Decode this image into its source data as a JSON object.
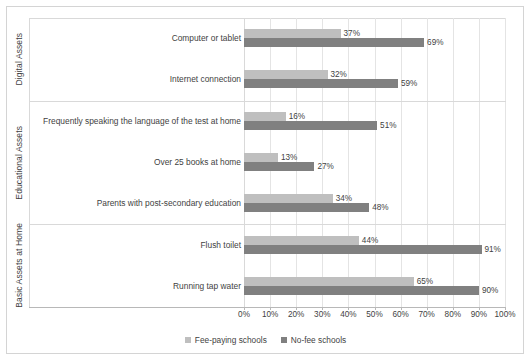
{
  "chart_data": {
    "type": "bar",
    "orientation": "horizontal",
    "title": "",
    "xlabel": "",
    "ylabel": "",
    "xlim": [
      0,
      100
    ],
    "xtick_labels": [
      "0%",
      "10%",
      "20%",
      "30%",
      "40%",
      "50%",
      "60%",
      "70%",
      "80%",
      "90%",
      "100%"
    ],
    "xtick_values": [
      0,
      10,
      20,
      30,
      40,
      50,
      60,
      70,
      80,
      90,
      100
    ],
    "grid": true,
    "legend_position": "bottom",
    "value_label_suffix": "%",
    "categories": [
      "Computer or tablet",
      "Internet connection",
      "Frequently speaking the language of the test at home",
      "Over 25 books at home",
      "Parents with post-secondary education",
      "Flush toilet",
      "Running tap water"
    ],
    "series": [
      {
        "name": "Fee-paying schools",
        "color": "#bfbfbf",
        "values": [
          37,
          32,
          16,
          13,
          34,
          44,
          65
        ],
        "value_labels": [
          "37%",
          "32%",
          "16%",
          "13%",
          "34%",
          "44%",
          "65%"
        ]
      },
      {
        "name": "No-fee schools",
        "color": "#808080",
        "values": [
          69,
          59,
          51,
          27,
          48,
          91,
          90
        ],
        "value_labels": [
          "69%",
          "59%",
          "51%",
          "27%",
          "48%",
          "91%",
          "90%"
        ]
      }
    ],
    "groups": [
      {
        "label": "Digital Assets",
        "categories": [
          "Computer or tablet",
          "Internet connection"
        ]
      },
      {
        "label": "Educational Assets",
        "categories": [
          "Frequently speaking the language of the test at home",
          "Over 25 books at home",
          "Parents with post-secondary education"
        ]
      },
      {
        "label": "Basic Assets at Home",
        "categories": [
          "Flush toilet",
          "Running tap water"
        ]
      }
    ]
  },
  "legend": {
    "items": [
      {
        "label": "Fee-paying schools",
        "color": "#bfbfbf"
      },
      {
        "label": "No-fee schools",
        "color": "#808080"
      }
    ]
  }
}
